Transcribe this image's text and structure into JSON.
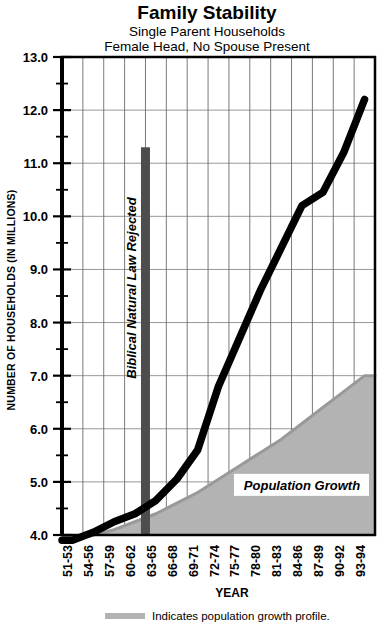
{
  "chart_data": {
    "type": "line",
    "title": "Family Stability",
    "subtitle_line1": "Single Parent Households",
    "subtitle_line2": "Female Head, No Spouse Present",
    "xlabel": "YEAR",
    "ylabel": "NUMBER OF HOUSEHOLDS (IN MILLIONS)",
    "ylim": [
      4.0,
      13.0
    ],
    "ytick_labels": [
      "13.0",
      "12.0",
      "11.0",
      "10.0",
      "9.0",
      "8.0",
      "7.0",
      "6.0",
      "5.0",
      "4.0"
    ],
    "ytick_values": [
      13.0,
      12.0,
      11.0,
      10.0,
      9.0,
      8.0,
      7.0,
      6.0,
      5.0,
      4.0
    ],
    "yminor_step": 0.5,
    "grid": true,
    "legend_position": "below",
    "categories": [
      "51-53",
      "54-56",
      "57-59",
      "60-62",
      "63-65",
      "66-68",
      "69-71",
      "72-74",
      "75-77",
      "78-80",
      "81-83",
      "84-86",
      "87-89",
      "90-92",
      "93-94"
    ],
    "series": [
      {
        "name": "Single parent households (female head, no spouse present)",
        "color": "#000000",
        "values": [
          3.9,
          4.05,
          4.25,
          4.4,
          4.65,
          5.05,
          5.6,
          6.8,
          7.7,
          8.6,
          9.4,
          10.2,
          10.45,
          11.2,
          12.2
        ]
      },
      {
        "name": "Population growth profile",
        "color": "#b3b3b3",
        "fill": true,
        "values": [
          3.9,
          4.0,
          4.1,
          4.25,
          4.4,
          4.6,
          4.8,
          5.05,
          5.3,
          5.55,
          5.8,
          6.1,
          6.4,
          6.7,
          7.0
        ]
      }
    ],
    "annotations": [
      {
        "id": "biblical-natural-law-rejected",
        "text": "Biblical Natural Law Rejected",
        "category": "60-62",
        "y_top": 11.3,
        "y_bottom": 4.0,
        "color": "#4d4d4d",
        "orientation": "vertical"
      },
      {
        "id": "population-growth",
        "text": "Population Growth",
        "category_center": "84-86",
        "y": 4.85
      }
    ],
    "legend": [
      {
        "swatch_color": "#b3b3b3",
        "label": "Indicates population growth profile."
      }
    ]
  }
}
